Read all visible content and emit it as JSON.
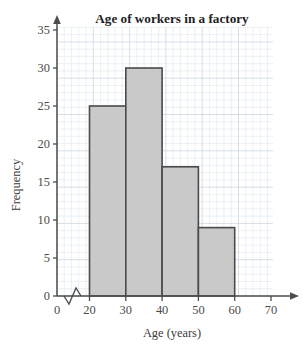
{
  "chart_data": {
    "type": "bar",
    "title": "Age of workers in a factory",
    "xlabel": "Age (years)",
    "ylabel": "Frequency",
    "categories": [
      "20-30",
      "30-40",
      "40-50",
      "50-60"
    ],
    "bin_edges": [
      20,
      30,
      40,
      50,
      60
    ],
    "values": [
      25,
      30,
      17,
      9
    ],
    "x_tick_labels": [
      "0",
      "20",
      "30",
      "40",
      "50",
      "60",
      "70"
    ],
    "x_tick_values": [
      0,
      20,
      30,
      40,
      50,
      60,
      70
    ],
    "y_tick_labels": [
      "0",
      "5",
      "10",
      "15",
      "20",
      "25",
      "30",
      "35"
    ],
    "y_tick_values": [
      0,
      5,
      10,
      15,
      20,
      25,
      30,
      35
    ],
    "xlim": [
      0,
      70
    ],
    "ylim": [
      0,
      35
    ],
    "grid": true,
    "legend": null,
    "axis_break_x": true,
    "bar_fill_color": "#c9c9c9",
    "bar_edge_color": "#4a4a4a",
    "grid_minor_color": "#dfe7ef",
    "grid_major_color": "#cfd9e4",
    "axis_color": "#4d4d4d",
    "title_color": "#1d1d1d"
  }
}
